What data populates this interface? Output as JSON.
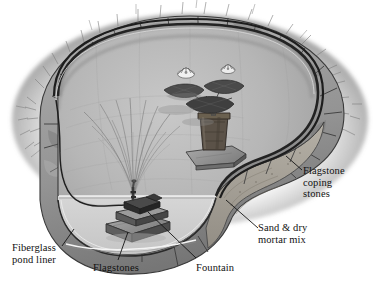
{
  "figure": {
    "kind": "cutaway-illustration",
    "palette": {
      "background": "#ffffff",
      "ink": "#111111",
      "pond_water_upper": "#b4b4b4",
      "pond_wall_lower": "#cfcfcf",
      "liner_dark": "#2b2b2b",
      "coping_stone": "#9a9a9a",
      "coping_stone_dark": "#6f6f6f",
      "sand_mortar": "#a8a49c",
      "grass": "#8b8b8b",
      "lily_pad": "#4a4a4a",
      "lily_flower": "#f2f2f2",
      "pot": "#5a5148",
      "flagstone": "#8e8e8e",
      "pump": "#3c3c3c"
    }
  },
  "labels": {
    "coping": "Flagstone\ncoping\nstones",
    "sand_mortar": "Sand & dry\nmortar mix",
    "liner": "Fiberglass\npond liner",
    "flagstones": "Flagstones",
    "fountain": "Fountain"
  },
  "callouts": [
    {
      "id": "coping",
      "text": "Flagstone coping stones",
      "target": "outer ring of flat stones at pond rim"
    },
    {
      "id": "sand_mortar",
      "text": "Sand & dry mortar mix",
      "target": "bedding layer beneath coping stones"
    },
    {
      "id": "liner",
      "text": "Fiberglass pond liner",
      "target": "rigid shell forming pond basin"
    },
    {
      "id": "flagstones",
      "text": "Flagstones",
      "target": "stacked stones supporting pump"
    },
    {
      "id": "fountain",
      "text": "Fountain",
      "target": "submersible pump and spray nozzle"
    }
  ],
  "scene_elements": [
    {
      "name": "water-lily-plant",
      "detail": "potted water lily with two white blooms and dark pads"
    },
    {
      "name": "fountain-spray",
      "detail": "fan of fine arcing water jets"
    },
    {
      "name": "waterline",
      "detail": "horizontal water surface line across pond interior"
    },
    {
      "name": "grass-tufts",
      "detail": "turf fringe outside the stone ring"
    },
    {
      "name": "pump-cord",
      "detail": "electrical cord routed from pump up the left wall"
    }
  ]
}
